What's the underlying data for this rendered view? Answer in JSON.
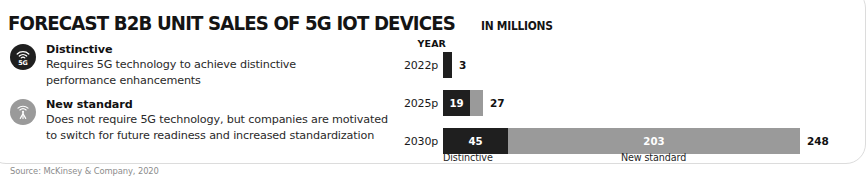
{
  "header": {
    "title": "FORECAST B2B UNIT SALES OF 5G IOT DEVICES",
    "subtitle": "IN MILLIONS"
  },
  "legend": {
    "items": [
      {
        "icon": "5g-signal-icon",
        "color": "#1f1f1f",
        "title": "Distinctive",
        "desc_line1": "Requires 5G technology to achieve distinctive",
        "desc_line2": "performance enhancements"
      },
      {
        "icon": "antenna-tower-icon",
        "color": "#9a9a9a",
        "title": "New standard",
        "desc_line1": "Does not require 5G technology, but companies are motivated",
        "desc_line2": "to switch for future readiness and increased standardization"
      }
    ]
  },
  "chart_labels": {
    "year_header": "YEAR",
    "axis_distinctive": "Distinctive",
    "axis_new_standard": "New standard"
  },
  "source": "Source: McKinsey & Company, 2020",
  "chart_data": {
    "type": "bar",
    "orientation": "horizontal",
    "stacked": true,
    "title": "FORECAST B2B UNIT SALES OF 5G IOT DEVICES",
    "subtitle": "IN MILLIONS",
    "xlabel": "",
    "ylabel": "YEAR",
    "unit": "millions of units",
    "grid": false,
    "legend_position": "left",
    "xlim": [
      0,
      248
    ],
    "categories": [
      "2022p",
      "2025p",
      "2030p"
    ],
    "series": [
      {
        "name": "Distinctive",
        "color": "#1f1f1f",
        "values": [
          3,
          19,
          45
        ]
      },
      {
        "name": "New standard",
        "color": "#9a9a9a",
        "values": [
          0,
          9,
          203
        ]
      }
    ],
    "totals": [
      3,
      27,
      248
    ],
    "annotations": [
      {
        "category": "2022p",
        "total_label": "3",
        "segment_labels": [
          "3",
          ""
        ]
      },
      {
        "category": "2025p",
        "total_label": "27",
        "segment_labels": [
          "19",
          "9"
        ]
      },
      {
        "category": "2030p",
        "total_label": "248",
        "segment_labels": [
          "45",
          "203"
        ]
      }
    ]
  }
}
